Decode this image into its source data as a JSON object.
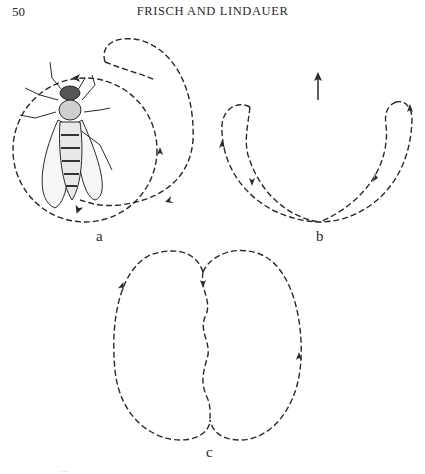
{
  "page": {
    "page_number": "50",
    "running_head": "FRISCH AND LINDAUER"
  },
  "figure": {
    "panels": [
      {
        "label": "a",
        "description": "bee drawing inside a dashed circular dance path with an extra outer loop and direction arrows"
      },
      {
        "label": "b",
        "description": "two crescent dashed loops meeting at bottom with an upward arrow above"
      },
      {
        "label": "c",
        "description": "figure-eight (waggle) dance with dashed loops and wavy central run"
      }
    ],
    "upward_arrow_icon": "arrow-up",
    "caption_partial": "…"
  }
}
